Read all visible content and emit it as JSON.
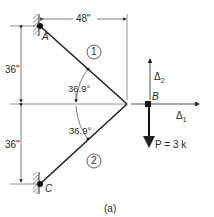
{
  "diagram": {
    "type": "truss",
    "caption": "(a)",
    "nodes": [
      {
        "id": "A",
        "label": "A",
        "support": "fixed-wall"
      },
      {
        "id": "B",
        "label": "B",
        "support": "free"
      },
      {
        "id": "C",
        "label": "C",
        "support": "fixed-wall"
      }
    ],
    "members": [
      {
        "id": "1",
        "label": "1",
        "from": "A",
        "to": "B"
      },
      {
        "id": "2",
        "label": "2",
        "from": "C",
        "to": "B"
      }
    ],
    "dimensions": {
      "horizontal": "48\"",
      "upper_vertical": "36\"",
      "lower_vertical": "36\""
    },
    "angles": {
      "upper": "36.9°",
      "lower": "36.9°"
    },
    "displacements": {
      "d1": "Δ",
      "d1_sub": "1",
      "d2": "Δ",
      "d2_sub": "2"
    },
    "load": {
      "label": "P = 3 k"
    }
  }
}
